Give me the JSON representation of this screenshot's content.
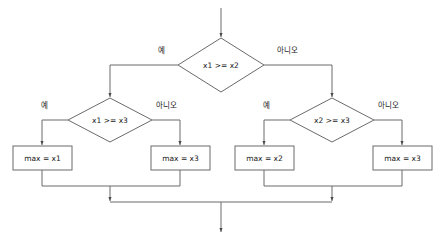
{
  "diagram": {
    "colors": {
      "stroke": "#6b6b6b",
      "text": "#1a1a1a",
      "background": "#ffffff"
    },
    "nodes": {
      "decision_top": "x1 >= x2",
      "decision_left": "x1 >= x3",
      "decision_right": "x2 >= x3",
      "box_1": "max = x1",
      "box_2": "max = x3",
      "box_3": "max = x2",
      "box_4": "max = x3"
    },
    "labels": {
      "yes": "예",
      "no": "아니오",
      "top_yes": "예",
      "top_no": "아니오",
      "left_yes": "예",
      "left_no": "아니오",
      "right_yes": "예",
      "right_no": "아니오"
    }
  }
}
